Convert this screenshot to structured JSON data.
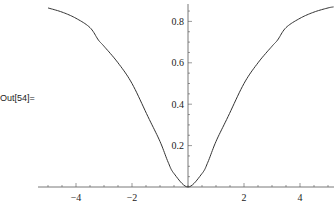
{
  "cell": {
    "output_label": "Out[54]="
  },
  "chart_data": {
    "type": "line",
    "title": "",
    "xlabel": "",
    "ylabel": "",
    "xlim": [
      -5.0,
      5.2
    ],
    "ylim": [
      0,
      0.87
    ],
    "grid": false,
    "legend": null,
    "x_ticks": [
      -4,
      -2,
      2,
      4
    ],
    "x_tick_labels": [
      "-4",
      "-2",
      "2",
      "4"
    ],
    "y_ticks": [
      0.2,
      0.4,
      0.6,
      0.8
    ],
    "y_tick_labels": [
      "0.2",
      "0.4",
      "0.6",
      "0.8"
    ],
    "series": [
      {
        "name": "curve",
        "color": "#333333",
        "x": [
          -5.0,
          -4.5,
          -4.0,
          -3.5,
          -3.2,
          -3.0,
          -2.5,
          -2.0,
          -1.43,
          -1.0,
          -0.71,
          -0.5,
          0,
          0.5,
          0.71,
          1.0,
          1.43,
          2.0,
          2.5,
          3.0,
          3.2,
          3.5,
          4.0,
          4.5,
          5.0,
          5.2
        ],
        "y": [
          0.865,
          0.845,
          0.815,
          0.77,
          0.71,
          0.68,
          0.6,
          0.5,
          0.34,
          0.22,
          0.12,
          0.065,
          0.0,
          0.065,
          0.12,
          0.22,
          0.34,
          0.5,
          0.6,
          0.68,
          0.71,
          0.77,
          0.815,
          0.845,
          0.865,
          0.87
        ]
      }
    ]
  }
}
